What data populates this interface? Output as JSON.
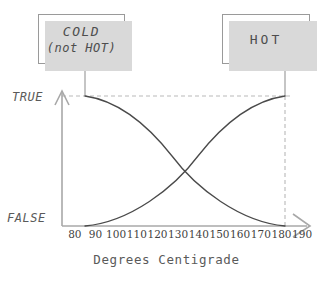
{
  "figure": {
    "boxes": [
      {
        "id": "cold",
        "line1": "COLD",
        "line2": "(not HOT)"
      },
      {
        "id": "hot",
        "line1": "HOT",
        "line2": ""
      }
    ],
    "y_axis": {
      "top_label": "TRUE",
      "bottom_label": "FALSE"
    },
    "x_axis": {
      "title": "Degrees Centigrade"
    },
    "colors": {
      "curve": "#4a4a4a",
      "axis": "#a8a8a8",
      "dashed": "#b9b9b9",
      "box_border": "#9a9a9a",
      "box_shadow": "#d9d9d9",
      "text": "#5a5a5a",
      "tick_text": "#3f3f3f"
    }
  },
  "chart_data": {
    "type": "line",
    "title": "",
    "subtitle": "",
    "xlabel": "Degrees Centigrade",
    "ylabel": "",
    "xlim": [
      75,
      195
    ],
    "ylim": [
      0,
      1
    ],
    "ytick_labels": [
      "FALSE",
      "TRUE"
    ],
    "ytick_values": [
      0,
      1
    ],
    "grid": false,
    "legend": "boxed-callouts",
    "annotations": [
      {
        "text": "COLD\n(not HOT)",
        "points_to_x": 80,
        "points_to_y": 1
      },
      {
        "text": "HOT",
        "points_to_x": 190,
        "points_to_y": 1
      }
    ],
    "categories": [
      80,
      90,
      100,
      110,
      120,
      130,
      140,
      150,
      160,
      170,
      180,
      190
    ],
    "x": [
      80,
      90,
      100,
      110,
      120,
      130,
      140,
      150,
      160,
      170,
      180,
      190
    ],
    "series": [
      {
        "name": "COLD (not HOT)",
        "values": [
          1.0,
          0.99,
          0.96,
          0.92,
          0.85,
          0.76,
          0.64,
          0.5,
          0.35,
          0.21,
          0.09,
          0.0
        ]
      },
      {
        "name": "HOT",
        "values": [
          0.0,
          0.02,
          0.06,
          0.13,
          0.22,
          0.33,
          0.45,
          0.57,
          0.7,
          0.82,
          0.93,
          1.0
        ]
      }
    ],
    "crossing_point": {
      "x": 149,
      "y": 0.5
    }
  }
}
